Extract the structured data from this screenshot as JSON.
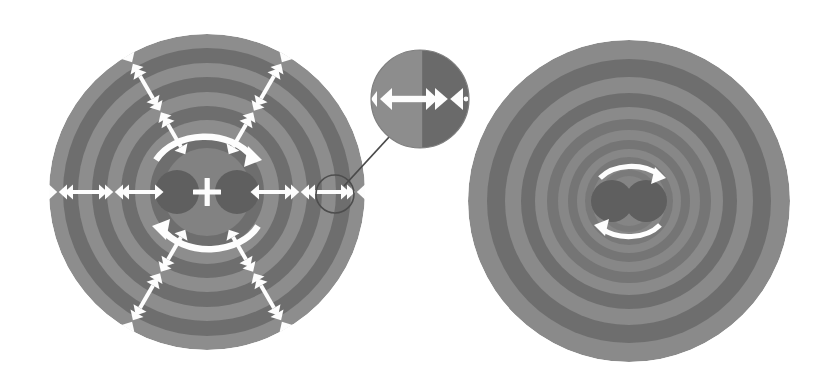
{
  "figure": {
    "background_color": "#ffffff",
    "colors": {
      "ring_light": "#8d8d8d",
      "ring_dark": "#6e6e6e",
      "core_dark": "#5f5f5f",
      "core_mid": "#7a7a7a",
      "arrow_white": "#fdfdfd",
      "leader_line": "#4a4a4a",
      "inset_light": "#8d8d8d",
      "inset_dark": "#6b6b6b"
    },
    "panels": [
      {
        "id": "left-disk",
        "label": "left-disk",
        "center_x": 207,
        "center_y": 192,
        "radius": 158,
        "ring_count": 11,
        "ring_widths": "uniform",
        "ring_boundaries_px": [
          158,
          144,
          129,
          115,
          100,
          86,
          72,
          57,
          44,
          30
        ],
        "spoke_count": 6,
        "spoke_angles_deg": [
          0,
          60,
          120,
          180,
          240,
          300
        ],
        "arrow_markers": "alternating expansion double-arrows and compression converging arrows along each spoke",
        "core": {
          "type": "two-lobe-dipole-separated",
          "lobe_radius": 22,
          "lobe_offset_x": 30,
          "center_symbol": "plus",
          "rotation_arrows": "two-arc-circular-arrows",
          "rotation_radius": 56
        },
        "callout_circle": {
          "x": 335,
          "y": 194,
          "r": 19
        }
      },
      {
        "id": "right-disk",
        "label": "right-disk",
        "center_x": 629,
        "center_y": 201,
        "radius": 161,
        "ring_count": 15,
        "ring_widths": "narrowing-toward-center",
        "ring_boundaries_px": [
          161,
          142,
          124,
          108,
          94,
          82,
          71,
          61,
          52,
          44,
          37,
          31,
          25,
          20,
          15
        ],
        "spoke_count": 0,
        "arrow_markers": "none",
        "core": {
          "type": "two-lobe-dipole-touching",
          "lobe_radius": 21,
          "lobe_offset_x": 17,
          "center_symbol": "none",
          "rotation_arrows": "two-arc-circular-arrows",
          "rotation_radius": 39
        }
      }
    ],
    "inset": {
      "id": "magnifier-inset",
      "label": "magnified-detail-inset",
      "center_x": 420,
      "center_y": 99,
      "radius": 49,
      "split_fraction": 0.52,
      "left_half_color": "#8d8d8d",
      "right_half_color": "#6b6b6b",
      "left_marker": "double-headed-arrow-expansion",
      "right_marker": "converging-arrows-compression",
      "leader_from": [
        390,
        136
      ],
      "leader_to": [
        344,
        186
      ]
    },
    "legend_note": ""
  }
}
